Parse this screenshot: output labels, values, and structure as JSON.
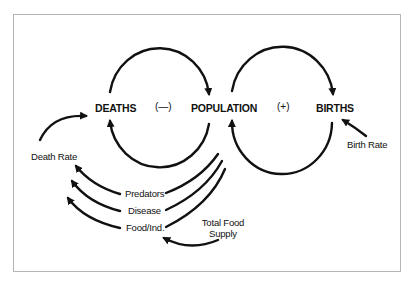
{
  "diagram": {
    "type": "causal-loop",
    "nodes": {
      "deaths": "DEATHS",
      "population": "POPULATION",
      "births": "BIRTHS"
    },
    "loop_signs": {
      "left": "(—)",
      "right": "(+)"
    },
    "factors": {
      "death_rate": "Death Rate",
      "birth_rate": "Birth Rate",
      "predators": "Predators",
      "disease": "Disease",
      "food_per_ind": "Food/Ind.",
      "total_food_line1": "Total Food",
      "total_food_line2": "Supply"
    },
    "colors": {
      "stroke": "#111111",
      "frame": "#b5b5b5",
      "background": "#ffffff"
    }
  }
}
